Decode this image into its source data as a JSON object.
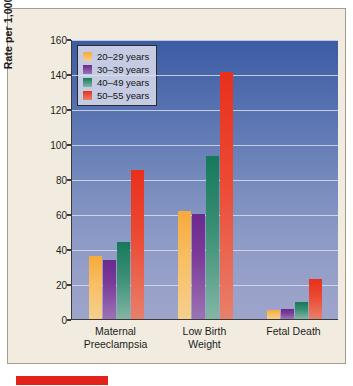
{
  "chart_data": {
    "type": "bar",
    "title": "",
    "xlabel": "",
    "ylabel": "Rate per 1,000 Deliveries",
    "ylim": [
      0,
      160
    ],
    "yticks": [
      0,
      20,
      40,
      60,
      80,
      100,
      120,
      140,
      160
    ],
    "grid": true,
    "legend_position": "top-left",
    "categories": [
      "Maternal Preeclampsia",
      "Low Birth Weight",
      "Fetal Death"
    ],
    "category_lines": [
      [
        "Maternal",
        "Preeclampsia"
      ],
      [
        "Low Birth",
        "Weight"
      ],
      [
        "Fetal Death",
        ""
      ]
    ],
    "series": [
      {
        "name": "20–29 years",
        "color": "#f6aa3c",
        "values": [
          36,
          62,
          5
        ]
      },
      {
        "name": "30–39 years",
        "color": "#6b2a8c",
        "values": [
          34,
          60,
          6
        ]
      },
      {
        "name": "40–49 years",
        "color": "#16795c",
        "values": [
          44,
          93,
          10
        ]
      },
      {
        "name": "50–55 years",
        "color": "#e8301c",
        "values": [
          85,
          141,
          23
        ]
      }
    ]
  },
  "figure": {
    "background": "#f2ece0",
    "plot_gradient_top": "#3b5ba4",
    "plot_gradient_bottom": "#9ea5cb",
    "marker_color": "#e2231a"
  }
}
